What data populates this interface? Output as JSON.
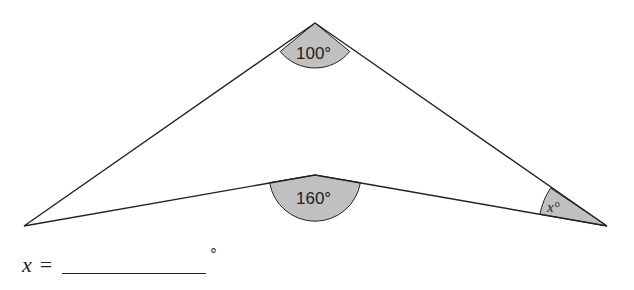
{
  "diagram": {
    "type": "concave quadrilateral (arrowhead/dart)",
    "vertices": {
      "left": [
        24,
        226
      ],
      "top": [
        315,
        23
      ],
      "inner": [
        315,
        175
      ],
      "right": [
        607,
        226
      ]
    },
    "angles": [
      {
        "vertex": "top",
        "label": "100°"
      },
      {
        "vertex": "inner",
        "label": "160°"
      },
      {
        "vertex": "right",
        "label": "x°",
        "var": "x"
      }
    ],
    "fill_color": "#c0c0c0",
    "stroke_color": "#222222"
  },
  "answer": {
    "variable": "x",
    "equals": "=",
    "value": "",
    "unit": "°"
  }
}
